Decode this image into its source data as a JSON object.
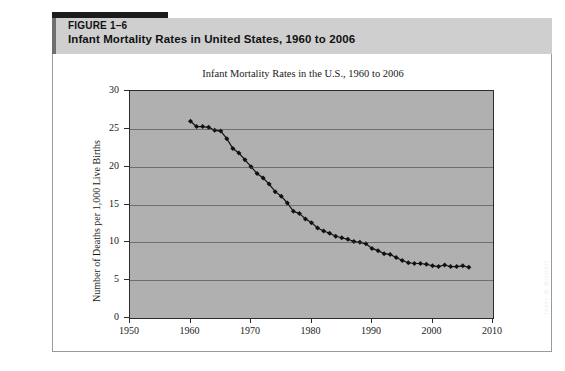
{
  "figure": {
    "label": "FIGURE 1–6",
    "title": "Infant Mortality Rates in United States, 1960 to 2006",
    "watermark": "Jones & Bartlett"
  },
  "chart_data": {
    "type": "line",
    "title": "Infant Mortality Rates in the U.S., 1960 to 2006",
    "xlabel": "",
    "ylabel": "Number of Deaths per 1,000 Live Births",
    "xlim": [
      1950,
      2010
    ],
    "ylim": [
      0,
      30
    ],
    "xticks": [
      1950,
      1960,
      1970,
      1980,
      1990,
      2000,
      2010
    ],
    "yticks": [
      0,
      5,
      10,
      15,
      20,
      25,
      30
    ],
    "grid": "horizontal",
    "legend": "none",
    "marker": "diamond",
    "series_name": "Infant mortality rate",
    "x": [
      1960,
      1961,
      1962,
      1963,
      1964,
      1965,
      1966,
      1967,
      1968,
      1969,
      1970,
      1971,
      1972,
      1973,
      1974,
      1975,
      1976,
      1977,
      1978,
      1979,
      1980,
      1981,
      1982,
      1983,
      1984,
      1985,
      1986,
      1987,
      1988,
      1989,
      1990,
      1991,
      1992,
      1993,
      1994,
      1995,
      1996,
      1997,
      1998,
      1999,
      2000,
      2001,
      2002,
      2003,
      2004,
      2005,
      2006
    ],
    "values": [
      26.0,
      25.3,
      25.3,
      25.2,
      24.8,
      24.7,
      23.7,
      22.4,
      21.8,
      20.9,
      20.0,
      19.1,
      18.5,
      17.7,
      16.7,
      16.1,
      15.2,
      14.1,
      13.8,
      13.1,
      12.6,
      11.9,
      11.5,
      11.2,
      10.8,
      10.6,
      10.4,
      10.1,
      10.0,
      9.8,
      9.2,
      8.9,
      8.5,
      8.4,
      8.0,
      7.6,
      7.3,
      7.2,
      7.2,
      7.1,
      6.9,
      6.8,
      7.0,
      6.8,
      6.8,
      6.9,
      6.7
    ]
  }
}
